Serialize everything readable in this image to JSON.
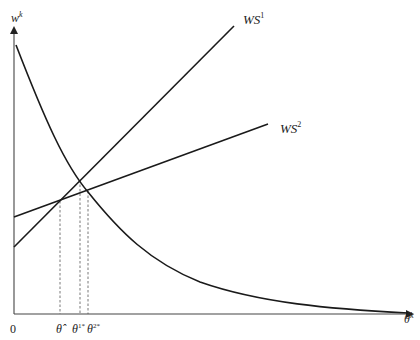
{
  "diagram": {
    "y_axis_label": "w",
    "y_axis_label_sup": "k",
    "x_axis_label": "θ",
    "x_axis_label_sup": "k",
    "origin_label": "0",
    "curves": [
      {
        "name": "WS1",
        "label": "WS",
        "sup": "1",
        "type": "line"
      },
      {
        "name": "WS2",
        "label": "WS",
        "sup": "2",
        "type": "line"
      },
      {
        "name": "demand-curve",
        "label": "",
        "type": "convex-decreasing"
      }
    ],
    "x_ticks": [
      {
        "label": "θ̂",
        "sup": ""
      },
      {
        "label": "θ",
        "sup": "1*"
      },
      {
        "label": "θ",
        "sup": "2*"
      }
    ],
    "colors": {
      "line": "#222222",
      "dashed": "#555555",
      "background": "#ffffff"
    }
  }
}
